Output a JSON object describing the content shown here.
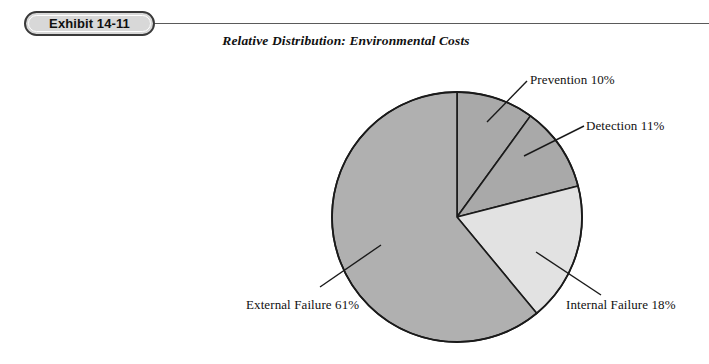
{
  "exhibit": {
    "badge_label": "Exhibit 14-11"
  },
  "chart_data": {
    "type": "pie",
    "title": "Relative Distribution: Environmental Costs",
    "subtitle": "",
    "xlabel": "",
    "ylabel": "",
    "legend_position": "none",
    "grid": false,
    "unit": "%",
    "start_angle_deg": 0,
    "direction": "clockwise",
    "categories": [
      "Prevention",
      "Detection",
      "Internal Failure",
      "External Failure"
    ],
    "values": [
      10,
      11,
      18,
      61
    ],
    "labels": [
      "Prevention 10%",
      "Detection 11%",
      "Internal Failure 18%",
      "External Failure 61%"
    ],
    "colors": [
      "#a9a9a9",
      "#a9a9a9",
      "#e2e2e2",
      "#b0b0b0"
    ],
    "slice_border_color": "#1a1a1a",
    "leader_line_color": "#1a1a1a"
  },
  "labels": {
    "prevention": "Prevention 10%",
    "detection": "Detection 11%",
    "internal_failure": "Internal Failure 18%",
    "external_failure": "External Failure 61%"
  }
}
